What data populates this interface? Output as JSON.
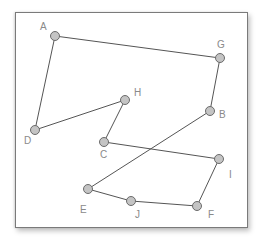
{
  "diagram": {
    "type": "graph",
    "colors": {
      "edge": "#555555",
      "node_fill": "#c4c4c4",
      "node_stroke": "#6b6b6b",
      "label": "#8a8a8a",
      "frame": "#7a7a7a"
    },
    "nodes": [
      {
        "id": "A",
        "label": "A",
        "x": 55,
        "y": 36,
        "lx": 40,
        "ly": 30
      },
      {
        "id": "G",
        "label": "G",
        "x": 220,
        "y": 58,
        "lx": 217,
        "ly": 48
      },
      {
        "id": "B",
        "label": "B",
        "x": 210,
        "y": 111,
        "lx": 219,
        "ly": 118
      },
      {
        "id": "H",
        "label": "H",
        "x": 125,
        "y": 100,
        "lx": 134,
        "ly": 96
      },
      {
        "id": "D",
        "label": "D",
        "x": 35,
        "y": 130,
        "lx": 24,
        "ly": 144
      },
      {
        "id": "C",
        "label": "C",
        "x": 104,
        "y": 142,
        "lx": 100,
        "ly": 158
      },
      {
        "id": "I",
        "label": "I",
        "x": 219,
        "y": 159,
        "lx": 229,
        "ly": 178
      },
      {
        "id": "E",
        "label": "E",
        "x": 88,
        "y": 189,
        "lx": 80,
        "ly": 213
      },
      {
        "id": "J",
        "label": "J",
        "x": 131,
        "y": 201,
        "lx": 135,
        "ly": 218
      },
      {
        "id": "F",
        "label": "F",
        "x": 197,
        "y": 206,
        "lx": 208,
        "ly": 218
      }
    ],
    "edges": [
      [
        "A",
        "G"
      ],
      [
        "G",
        "B"
      ],
      [
        "B",
        "E"
      ],
      [
        "E",
        "J"
      ],
      [
        "J",
        "F"
      ],
      [
        "F",
        "I"
      ],
      [
        "I",
        "C"
      ],
      [
        "C",
        "H"
      ],
      [
        "H",
        "D"
      ],
      [
        "D",
        "A"
      ]
    ]
  }
}
